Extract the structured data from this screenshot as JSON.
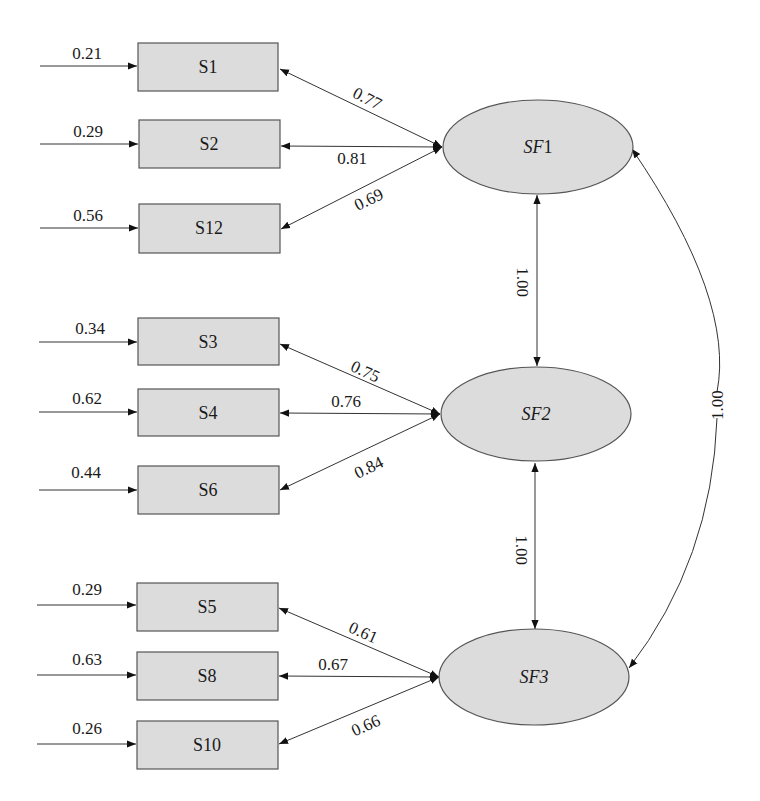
{
  "diagram": {
    "type": "confirmatory factor analysis path diagram",
    "colors": {
      "node_fill": "#dcdcdc",
      "node_stroke": "#555555",
      "edge": "#333333",
      "text": "#1a1a1a"
    },
    "factors": [
      {
        "id": "SF1",
        "prefix": "SF",
        "num": "1"
      },
      {
        "id": "SF2",
        "prefix": "SF",
        "num": "2"
      },
      {
        "id": "SF3",
        "prefix": "SF",
        "num": "3"
      }
    ],
    "indicators": [
      {
        "label": "S1",
        "error": "0.21",
        "loading": "0.77",
        "factor": "SF1"
      },
      {
        "label": "S2",
        "error": "0.29",
        "loading": "0.81",
        "factor": "SF1"
      },
      {
        "label": "S12",
        "error": "0.56",
        "loading": "0.69",
        "factor": "SF1"
      },
      {
        "label": "S3",
        "error": "0.34",
        "loading": "0.75",
        "factor": "SF2"
      },
      {
        "label": "S4",
        "error": "0.62",
        "loading": "0.76",
        "factor": "SF2"
      },
      {
        "label": "S6",
        "error": "0.44",
        "loading": "0.84",
        "factor": "SF2"
      },
      {
        "label": "S5",
        "error": "0.29",
        "loading": "0.61",
        "factor": "SF3"
      },
      {
        "label": "S8",
        "error": "0.63",
        "loading": "0.67",
        "factor": "SF3"
      },
      {
        "label": "S10",
        "error": "0.26",
        "loading": "0.66",
        "factor": "SF3"
      }
    ],
    "correlations": [
      {
        "from": "SF1",
        "to": "SF2",
        "value": "1.00"
      },
      {
        "from": "SF2",
        "to": "SF3",
        "value": "1.00"
      },
      {
        "from": "SF1",
        "to": "SF3",
        "value": "1.00"
      }
    ]
  }
}
